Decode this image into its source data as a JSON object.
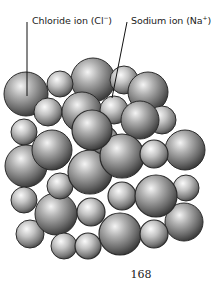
{
  "diagram": {
    "labels": [
      {
        "id": "chloride",
        "text": "Chloride ion (Cl",
        "charge": "−",
        "close": ")"
      },
      {
        "id": "sodium",
        "text": "Sodium ion (Na",
        "charge": "+",
        "close": ")"
      }
    ],
    "colors": {
      "sphere_light": "#f2f2f2",
      "sphere_mid": "#9a9a9a",
      "sphere_dark": "#3a3a3a",
      "outline": "#2b2b2b",
      "leader_line": "#111111"
    }
  },
  "footer": {
    "page_number": "168"
  }
}
